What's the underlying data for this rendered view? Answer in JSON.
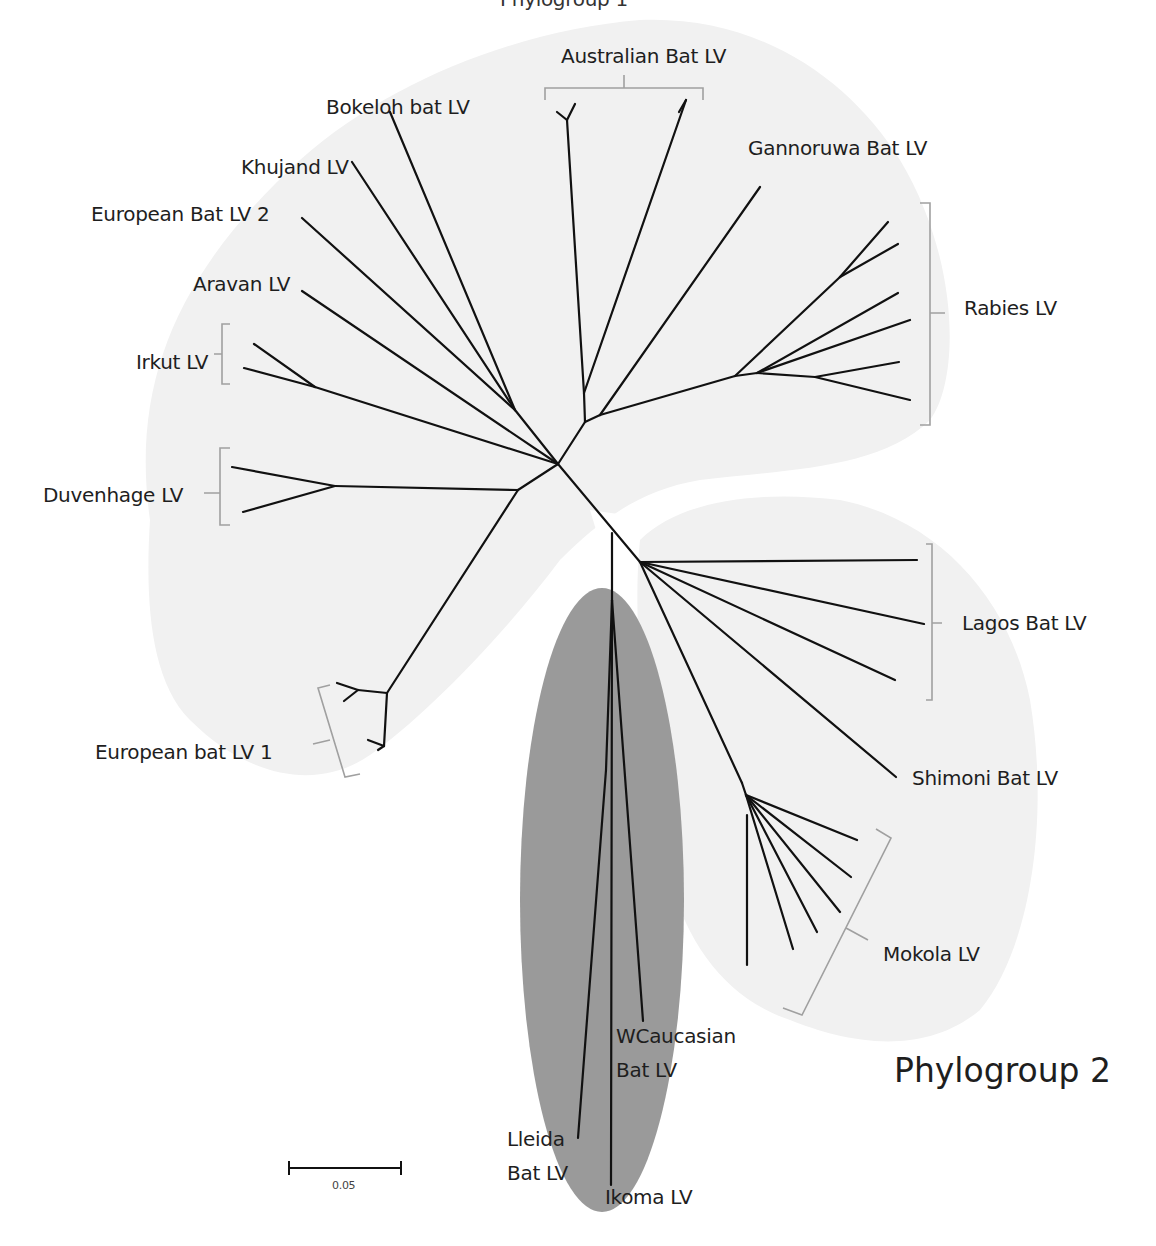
{
  "figure": {
    "title_clipped": "Phylogroup 1",
    "phylogroup2_label": "Phylogroup 2",
    "scale_bar": {
      "value_label": "0.05",
      "x1": 289,
      "x2": 401,
      "y": 1168
    },
    "colors": {
      "background": "#ffffff",
      "branch": "#111111",
      "bracket": "#a0a0a0",
      "phylogroup1_fill": "#f1f1f1",
      "phylogroup2_fill": "#f1f1f1",
      "phylogroup3_fill": "#9a9a9a",
      "label_text": "#1e1e1e"
    }
  },
  "labels": {
    "australian": "Australian Bat LV",
    "bokeloh": "Bokeloh bat LV",
    "gannoruwa": "Gannoruwa Bat LV",
    "khujand": "Khujand LV",
    "eblv2": "European Bat LV 2",
    "aravan": "Aravan LV",
    "rabies": "Rabies LV",
    "irkut": "Irkut LV",
    "duvenhage": "Duvenhage LV",
    "lagos": "Lagos Bat LV",
    "eblv1": "European bat LV 1",
    "shimoni": "Shimoni Bat LV",
    "mokola": "Mokola LV",
    "wcaucasian_1": "WCaucasian",
    "wcaucasian_2": "Bat LV",
    "lleida_1": "Lleida",
    "lleida_2": "Bat LV",
    "ikoma": "Ikoma LV"
  },
  "chart_data": {
    "type": "unrooted phylogenetic tree",
    "scale_bar": 0.05,
    "groups": [
      {
        "name": "Phylogroup 1",
        "taxa": [
          "Australian Bat LV",
          "Bokeloh bat LV",
          "Gannoruwa Bat LV",
          "Khujand LV",
          "European Bat LV 2",
          "Aravan LV",
          "Rabies LV",
          "Irkut LV",
          "Duvenhage LV",
          "European bat LV 1"
        ]
      },
      {
        "name": "Phylogroup 2",
        "taxa": [
          "Lagos Bat LV",
          "Shimoni Bat LV",
          "Mokola LV"
        ]
      },
      {
        "name": "Phylogroup 3",
        "taxa": [
          "WCaucasian Bat LV",
          "Lleida Bat LV",
          "Ikoma LV"
        ]
      }
    ],
    "branches": [
      [
        558,
        464,
        515,
        410
      ],
      [
        515,
        410,
        390,
        112
      ],
      [
        515,
        410,
        352,
        162
      ],
      [
        515,
        410,
        302,
        218
      ],
      [
        558,
        464,
        302,
        291
      ],
      [
        558,
        464,
        315,
        387
      ],
      [
        315,
        387,
        254,
        344
      ],
      [
        315,
        387,
        244,
        368
      ],
      [
        558,
        464,
        518,
        490
      ],
      [
        518,
        490,
        335,
        486
      ],
      [
        335,
        486,
        232,
        467
      ],
      [
        335,
        486,
        243,
        512
      ],
      [
        518,
        490,
        387,
        693
      ],
      [
        387,
        693,
        358,
        690
      ],
      [
        358,
        690,
        337,
        683
      ],
      [
        358,
        690,
        344,
        701
      ],
      [
        387,
        693,
        384,
        746
      ],
      [
        384,
        746,
        368,
        740
      ],
      [
        384,
        746,
        378,
        750
      ],
      [
        558,
        464,
        585,
        422
      ],
      [
        585,
        422,
        584,
        393
      ],
      [
        584,
        393,
        567,
        120
      ],
      [
        567,
        120,
        557,
        112
      ],
      [
        567,
        120,
        575,
        104
      ],
      [
        584,
        393,
        686,
        100
      ],
      [
        686,
        100,
        679,
        112
      ],
      [
        585,
        422,
        600,
        415
      ],
      [
        600,
        415,
        760,
        187
      ],
      [
        600,
        415,
        735,
        376
      ],
      [
        735,
        376,
        840,
        277
      ],
      [
        840,
        277,
        888,
        222
      ],
      [
        840,
        277,
        898,
        244
      ],
      [
        735,
        376,
        757,
        373
      ],
      [
        757,
        373,
        898,
        293
      ],
      [
        757,
        373,
        910,
        320
      ],
      [
        757,
        373,
        815,
        377
      ],
      [
        815,
        377,
        899,
        362
      ],
      [
        815,
        377,
        910,
        400
      ],
      [
        558,
        464,
        640,
        562
      ],
      [
        640,
        562,
        917,
        560
      ],
      [
        640,
        562,
        924,
        624
      ],
      [
        640,
        562,
        895,
        680
      ],
      [
        640,
        562,
        896,
        777
      ],
      [
        640,
        562,
        742,
        783
      ],
      [
        742,
        783,
        746,
        795
      ],
      [
        746,
        795,
        857,
        840
      ],
      [
        746,
        795,
        851,
        877
      ],
      [
        746,
        795,
        840,
        912
      ],
      [
        746,
        795,
        817,
        932
      ],
      [
        746,
        795,
        793,
        949
      ],
      [
        747,
        815,
        747,
        965
      ],
      [
        612,
        533,
        612,
        600
      ],
      [
        612,
        600,
        606,
        770
      ],
      [
        606,
        770,
        578,
        1138
      ],
      [
        612,
        600,
        611,
        1185
      ],
      [
        612,
        600,
        643,
        1021
      ]
    ]
  }
}
